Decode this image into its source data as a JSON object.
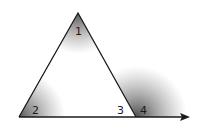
{
  "diagram": {
    "type": "triangle-exterior-angle",
    "angle_labels": {
      "apex": "1",
      "bottom_left": "2",
      "bottom_right_interior": "3",
      "exterior": "4"
    },
    "base_extended_as_ray": true,
    "colors": {
      "line": "#1a1a1a",
      "shade": "#6e6e6e",
      "background": "#ffffff"
    }
  }
}
